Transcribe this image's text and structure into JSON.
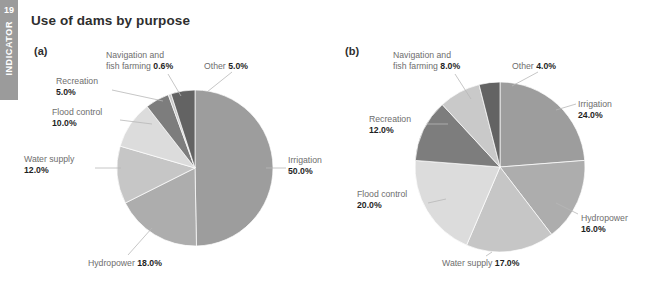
{
  "indicator": {
    "number": "19",
    "word": "INDICATOR"
  },
  "title": "Use of dams by purpose",
  "panels": {
    "a_letter": "(a)",
    "b_letter": "(b)"
  },
  "colors": {
    "irrigation": "#9d9d9d",
    "hydropower": "#adadad",
    "water_supply": "#c6c6c6",
    "flood_control": "#dcdcdc",
    "recreation": "#7d7d7d",
    "navigation_fish_farming": "#c9c9c9",
    "other": "#636363",
    "label_text": "#6e6e6e",
    "value_text": "#1f1f1f",
    "leader_line": "#b8b8b8",
    "tab_bg": "#9b9b9b",
    "title_text": "#2e2e2e"
  },
  "chart_data": [
    {
      "type": "pie",
      "id": "a",
      "title": "(a)",
      "categories": [
        "Irrigation",
        "Hydropower",
        "Water supply",
        "Flood control",
        "Recreation",
        "Navigation and fish farming",
        "Other"
      ],
      "values": [
        50.0,
        18.0,
        12.0,
        10.0,
        5.0,
        0.6,
        5.0
      ],
      "value_labels": [
        "50.0%",
        "18.0%",
        "12.0%",
        "10.0%",
        "5.0%",
        "0.6%",
        "5.0%"
      ],
      "slice_colors": [
        "#9d9d9d",
        "#adadad",
        "#c6c6c6",
        "#dcdcdc",
        "#7d7d7d",
        "#c9c9c9",
        "#636363"
      ],
      "start_angle_deg": 0,
      "legend": "none",
      "grid": false
    },
    {
      "type": "pie",
      "id": "b",
      "title": "(b)",
      "categories": [
        "Irrigation",
        "Hydropower",
        "Water supply",
        "Flood control",
        "Recreation",
        "Navigation and fish farming",
        "Other"
      ],
      "values": [
        24.0,
        16.0,
        17.0,
        20.0,
        12.0,
        8.0,
        4.0
      ],
      "value_labels": [
        "24.0%",
        "16.0%",
        "17.0%",
        "20.0%",
        "12.0%",
        "8.0%",
        "4.0%"
      ],
      "slice_colors": [
        "#9d9d9d",
        "#adadad",
        "#c6c6c6",
        "#dcdcdc",
        "#7d7d7d",
        "#c9c9c9",
        "#636363"
      ],
      "start_angle_deg": 0,
      "legend": "none",
      "grid": false
    }
  ],
  "labels_a": {
    "navigation": {
      "line1": "Navigation and",
      "line2": "fish farming ",
      "value": "0.6%"
    },
    "other": {
      "line1": "Other ",
      "value": "5.0%"
    },
    "recreation": {
      "line1": "Recreation",
      "value": "5.0%"
    },
    "flood_control": {
      "line1": "Flood control",
      "value": "10.0%"
    },
    "water_supply": {
      "line1": "Water supply",
      "value": "12.0%"
    },
    "hydropower": {
      "line1": "Hydropower ",
      "value": "18.0%"
    },
    "irrigation": {
      "line1": "Irrigation",
      "value": "50.0%"
    }
  },
  "labels_b": {
    "navigation": {
      "line1": "Navigation and",
      "line2": "fish farming ",
      "value": "8.0%"
    },
    "other": {
      "line1": "Other ",
      "value": "4.0%"
    },
    "recreation": {
      "line1": "Recreation",
      "value": "12.0%"
    },
    "flood_control": {
      "line1": "Flood control",
      "value": "20.0%"
    },
    "water_supply": {
      "line1": "Water supply ",
      "value": "17.0%"
    },
    "hydropower": {
      "line1": "Hydropower",
      "value": "16.0%"
    },
    "irrigation": {
      "line1": "Irrigation",
      "value": "24.0%"
    }
  }
}
